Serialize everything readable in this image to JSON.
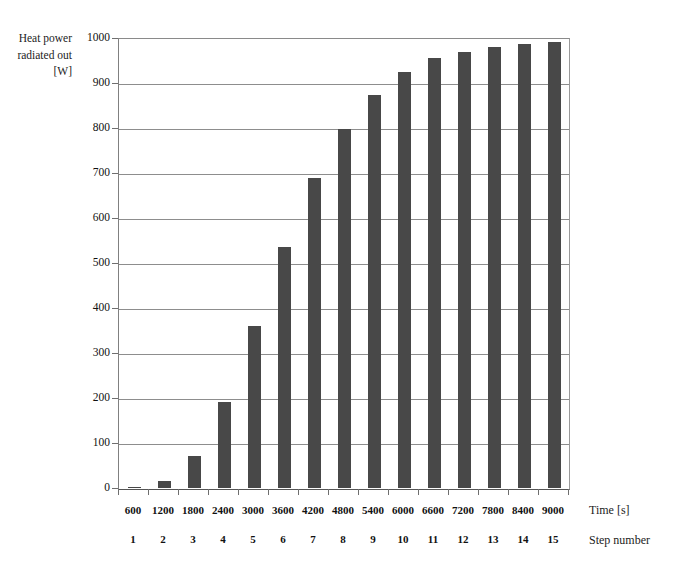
{
  "chart_data": {
    "type": "bar",
    "title": "",
    "ylabel": "Heat power radiated out [W]",
    "xlabel": "Time [s]",
    "xlabel_secondary": "Step number",
    "categories": [
      "600",
      "1200",
      "1800",
      "2400",
      "3000",
      "3600",
      "4200",
      "4800",
      "5400",
      "6000",
      "6600",
      "7200",
      "7800",
      "8400",
      "9000"
    ],
    "step_numbers": [
      "1",
      "2",
      "3",
      "4",
      "5",
      "6",
      "7",
      "8",
      "9",
      "10",
      "11",
      "12",
      "13",
      "14",
      "15"
    ],
    "values": [
      3,
      15,
      72,
      192,
      360,
      535,
      688,
      798,
      874,
      925,
      955,
      970,
      980,
      987,
      991
    ],
    "ylim": [
      0,
      1000
    ],
    "yticks": [
      "0",
      "100",
      "200",
      "300",
      "400",
      "500",
      "600",
      "700",
      "800",
      "900",
      "1000"
    ],
    "ytick_values": [
      0,
      100,
      200,
      300,
      400,
      500,
      600,
      700,
      800,
      900,
      1000
    ],
    "grid": true,
    "legend": "none",
    "bar_color": "#484848",
    "grid_color": "#8d8d8d",
    "axis_color": "#555555"
  },
  "axis": {
    "y_title_line1": "Heat power",
    "y_title_line2": "radiated out",
    "y_title_line3": "[W]",
    "y_title": "Heat power\nradiated out\n[W]",
    "x_caption_time": "Time [s]",
    "x_caption_step": "Step number"
  }
}
